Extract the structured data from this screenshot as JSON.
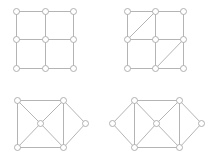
{
  "figure": {
    "width": 216,
    "height": 158,
    "edge_color": "#b4b4b4",
    "node_stroke": "#a8a8a8",
    "node_fill": "#ffffff",
    "node_radius": 3
  },
  "graphs": [
    {
      "name": "grid-graph",
      "nodes": [
        [
          16,
          11
        ],
        [
          45,
          11
        ],
        [
          73,
          11
        ],
        [
          16,
          39
        ],
        [
          45,
          39
        ],
        [
          73,
          39
        ],
        [
          16,
          68
        ],
        [
          45,
          68
        ],
        [
          73,
          68
        ]
      ],
      "edges": [
        [
          0,
          1
        ],
        [
          1,
          2
        ],
        [
          3,
          4
        ],
        [
          4,
          5
        ],
        [
          6,
          7
        ],
        [
          7,
          8
        ],
        [
          0,
          3
        ],
        [
          3,
          6
        ],
        [
          1,
          4
        ],
        [
          4,
          7
        ],
        [
          2,
          5
        ],
        [
          5,
          8
        ]
      ]
    },
    {
      "name": "triangulated-grid-graph",
      "nodes": [
        [
          127,
          11
        ],
        [
          155,
          11
        ],
        [
          183,
          11
        ],
        [
          127,
          39
        ],
        [
          155,
          39
        ],
        [
          183,
          39
        ],
        [
          127,
          68
        ],
        [
          155,
          68
        ],
        [
          183,
          68
        ]
      ],
      "edges": [
        [
          0,
          1
        ],
        [
          1,
          2
        ],
        [
          3,
          4
        ],
        [
          4,
          5
        ],
        [
          6,
          7
        ],
        [
          7,
          8
        ],
        [
          0,
          3
        ],
        [
          3,
          6
        ],
        [
          1,
          4
        ],
        [
          4,
          7
        ],
        [
          2,
          5
        ],
        [
          5,
          8
        ],
        [
          1,
          3
        ],
        [
          5,
          7
        ]
      ]
    },
    {
      "name": "bowtie-wheel-graph",
      "nodes": [
        [
          17,
          100
        ],
        [
          63,
          100
        ],
        [
          40,
          123
        ],
        [
          85,
          123
        ],
        [
          17,
          147
        ],
        [
          63,
          147
        ]
      ],
      "edges": [
        [
          0,
          1
        ],
        [
          4,
          5
        ],
        [
          0,
          4
        ],
        [
          1,
          5
        ],
        [
          0,
          2
        ],
        [
          2,
          5
        ],
        [
          1,
          2
        ],
        [
          2,
          4
        ],
        [
          1,
          3
        ],
        [
          3,
          5
        ]
      ]
    },
    {
      "name": "double-diamond-graph",
      "nodes": [
        [
          112,
          123
        ],
        [
          134,
          100
        ],
        [
          179,
          100
        ],
        [
          156,
          123
        ],
        [
          201,
          123
        ],
        [
          134,
          147
        ],
        [
          179,
          147
        ]
      ],
      "edges": [
        [
          0,
          1
        ],
        [
          0,
          5
        ],
        [
          1,
          2
        ],
        [
          5,
          6
        ],
        [
          1,
          5
        ],
        [
          2,
          6
        ],
        [
          1,
          3
        ],
        [
          3,
          5
        ],
        [
          2,
          3
        ],
        [
          3,
          6
        ],
        [
          2,
          4
        ],
        [
          4,
          6
        ]
      ]
    }
  ]
}
